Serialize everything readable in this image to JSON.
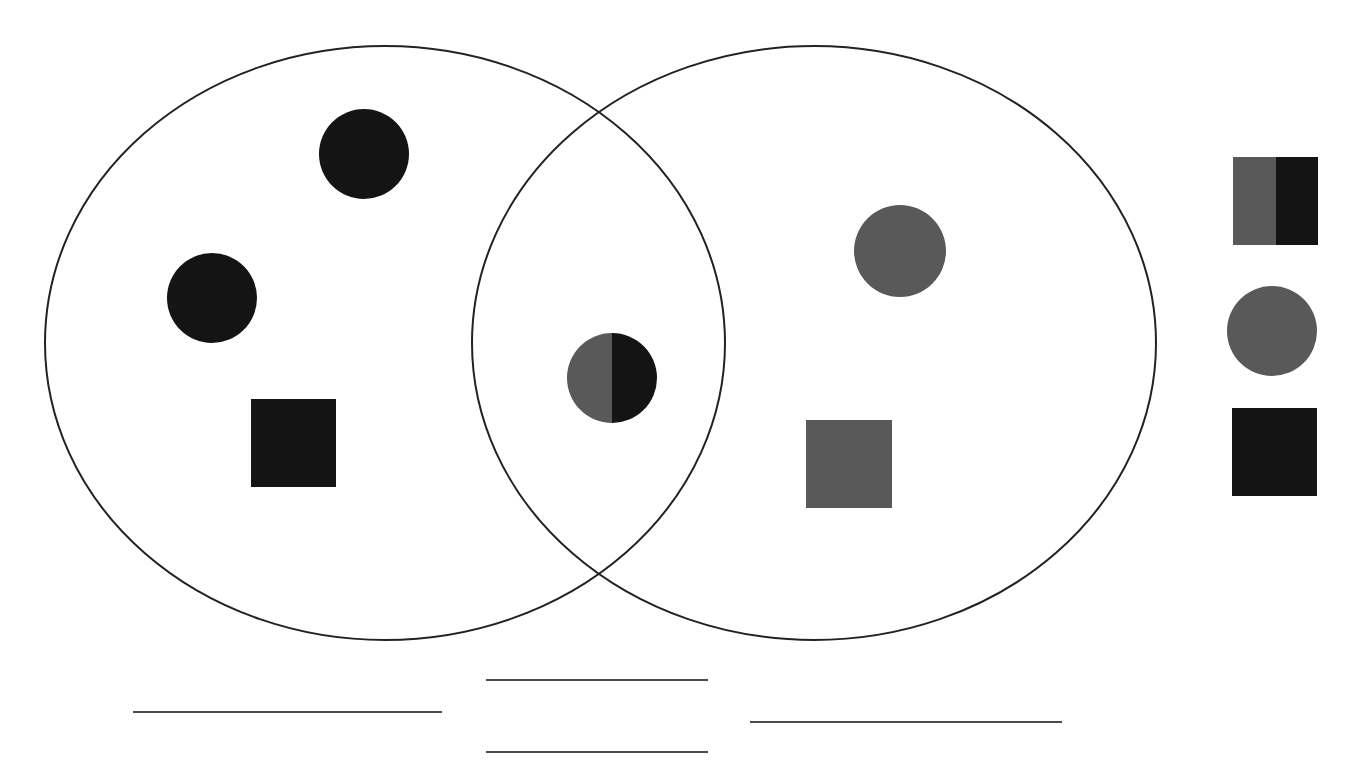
{
  "diagram": {
    "type": "venn",
    "colors": {
      "black": "#141414",
      "gray": "#595959",
      "outline": "#222222"
    },
    "sets": [
      {
        "name": "left-set",
        "cx": 385,
        "cy": 343,
        "rx": 340,
        "ry": 297
      },
      {
        "name": "right-set",
        "cx": 814,
        "cy": 343,
        "rx": 342,
        "ry": 297
      }
    ],
    "items": [
      {
        "name": "black-circle",
        "region": "left-only",
        "shape": "circle",
        "color": "black",
        "cx": 364,
        "cy": 154,
        "r": 45
      },
      {
        "name": "black-circle",
        "region": "left-only",
        "shape": "circle",
        "color": "black",
        "cx": 212,
        "cy": 298,
        "r": 45
      },
      {
        "name": "black-square",
        "region": "left-only",
        "shape": "square",
        "color": "black",
        "x": 251,
        "y": 399,
        "w": 85,
        "h": 88
      },
      {
        "name": "half-gray-half-black-circle",
        "region": "intersection",
        "shape": "split-circle",
        "color": "gray-black",
        "cx": 612,
        "cy": 378,
        "r": 45
      },
      {
        "name": "gray-circle",
        "region": "right-only",
        "shape": "circle",
        "color": "gray",
        "cx": 900,
        "cy": 251,
        "r": 46
      },
      {
        "name": "gray-square",
        "region": "right-only",
        "shape": "square",
        "color": "gray",
        "x": 806,
        "y": 420,
        "w": 86,
        "h": 88
      }
    ],
    "legend_shapes": [
      {
        "name": "half-gray-half-black-square",
        "shape": "split-square",
        "x": 1233,
        "y": 157,
        "w": 85,
        "h": 88
      },
      {
        "name": "gray-circle",
        "shape": "circle",
        "color": "gray",
        "cx": 1272,
        "cy": 331,
        "r": 45
      },
      {
        "name": "black-square",
        "shape": "square",
        "color": "black",
        "x": 1232,
        "y": 408,
        "w": 85,
        "h": 88
      }
    ],
    "answer_lines": [
      {
        "name": "left-answer-line",
        "x1": 133,
        "x2": 442,
        "y": 712
      },
      {
        "name": "middle-top-answer-line",
        "x1": 486,
        "x2": 708,
        "y": 680
      },
      {
        "name": "middle-bottom-answer-line",
        "x1": 486,
        "x2": 708,
        "y": 752
      },
      {
        "name": "right-answer-line",
        "x1": 750,
        "x2": 1062,
        "y": 722
      }
    ]
  }
}
